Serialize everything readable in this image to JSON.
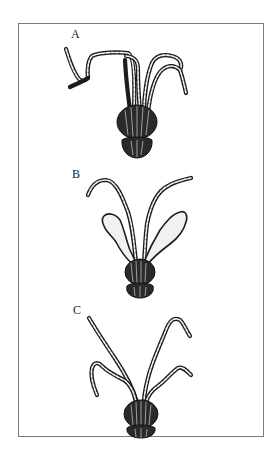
{
  "figure": {
    "panels": [
      {
        "id": "A",
        "label": "A"
      },
      {
        "id": "B",
        "label": "B"
      },
      {
        "id": "C",
        "label": "C"
      }
    ]
  },
  "colors": {
    "ink": "#1c1c1c",
    "frame": "#7a7a7a",
    "background": "#ffffff"
  }
}
